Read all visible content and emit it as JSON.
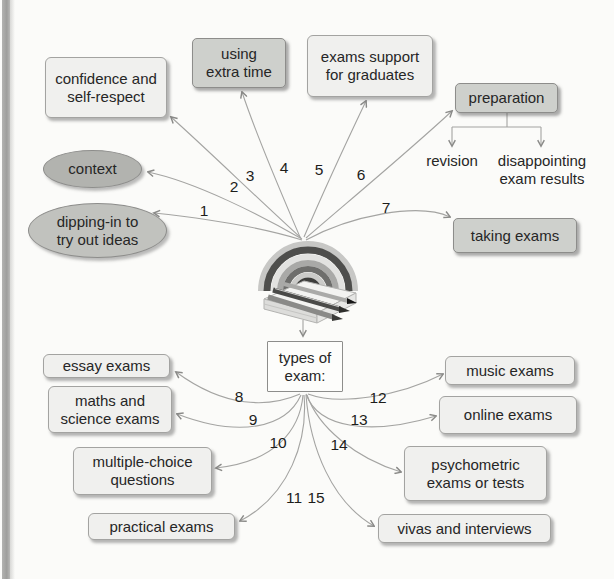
{
  "colors": {
    "page_bg": "#fbfbf9",
    "edge_strip": "#a5a5a3",
    "connector_line": "#a0a09e",
    "text": "#262626",
    "light_box_fill": "#f0f0ee",
    "gray_box_fill": "#ced0cc",
    "ellipse_fill": "#b9bab6"
  },
  "numbers": [
    "1",
    "2",
    "3",
    "4",
    "5",
    "6",
    "7",
    "8",
    "9",
    "10",
    "11",
    "12",
    "13",
    "14",
    "15"
  ],
  "center": {
    "image_icon": "rainbow-notepad-pens",
    "hub_label": "types of\nexam:"
  },
  "branches": {
    "top": [
      {
        "n": "1",
        "label": "dipping-in to\ntry out ideas"
      },
      {
        "n": "2",
        "label": "context"
      },
      {
        "n": "3",
        "label": "confidence and\nself-respect"
      },
      {
        "n": "4",
        "label": "using\nextra time"
      },
      {
        "n": "5",
        "label": "exams support\nfor graduates"
      },
      {
        "n": "6",
        "label": "preparation"
      },
      {
        "n": "7",
        "label": "taking exams"
      }
    ],
    "preparation_children": [
      {
        "label": "revision"
      },
      {
        "label": "disappointing\nexam results"
      }
    ],
    "bottom": [
      {
        "n": "8",
        "label": "essay exams"
      },
      {
        "n": "9",
        "label": "maths and\nscience exams"
      },
      {
        "n": "10",
        "label": "multiple-choice\nquestions"
      },
      {
        "n": "11",
        "label": "practical exams"
      },
      {
        "n": "12",
        "label": "music exams"
      },
      {
        "n": "13",
        "label": "online exams"
      },
      {
        "n": "14",
        "label": "psychometric\nexams or tests"
      },
      {
        "n": "15",
        "label": "vivas and interviews"
      }
    ]
  }
}
